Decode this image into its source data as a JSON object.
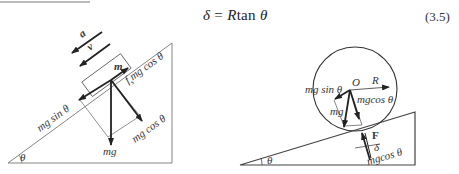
{
  "top_text_fragment": "（截断文字）",
  "equation": {
    "lhs": "δ",
    "eq": " = ",
    "R": "R",
    "func": "tan ",
    "theta": "θ",
    "number": "(3.5)"
  },
  "left_figure": {
    "label_a": "a",
    "label_v": "v",
    "label_m": "m",
    "label_friction": "f",
    "label_friction_sub": "s",
    "label_friction_rest": "mg cos θ",
    "label_mg_sin": "mg sin θ",
    "label_mg_cos": "mg cos θ",
    "label_mg": "mg",
    "label_theta": "θ"
  },
  "right_figure": {
    "label_mg_sin": "mg sin θ",
    "label_O": "O",
    "label_R": "R",
    "label_mg_cos_top": "mgcos θ",
    "label_mg": "mg",
    "label_F": "F",
    "label_delta": "δ",
    "label_mg_cos_bottom": "mgcos θ",
    "label_theta": "θ"
  },
  "colors": {
    "line": "#555555",
    "arrow": "#222222",
    "text": "#333333"
  }
}
